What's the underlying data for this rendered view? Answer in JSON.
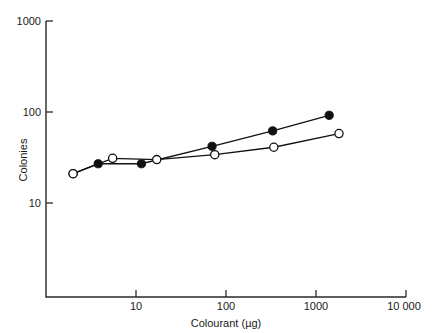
{
  "chart_data": {
    "type": "line",
    "title": "",
    "xlabel": "Colourant (µg)",
    "ylabel": "Colonies",
    "xscale": "log",
    "yscale": "log",
    "xlim": [
      2,
      10000
    ],
    "ylim": [
      5.7,
      1000
    ],
    "grid": false,
    "legend": "none",
    "xticks": [
      {
        "value": 10,
        "label": "10"
      },
      {
        "value": 100,
        "label": "100"
      },
      {
        "value": 1000,
        "label": "1000"
      },
      {
        "value": 10000,
        "label": "10 000"
      }
    ],
    "yticks": [
      {
        "value": 10,
        "label": "10"
      },
      {
        "value": 100,
        "label": "100"
      },
      {
        "value": 1000,
        "label": "1000"
      }
    ],
    "series": [
      {
        "name": "filled-circles",
        "marker": "filled-circle",
        "color": "#111111",
        "points": [
          {
            "x": 2.0,
            "y": 21
          },
          {
            "x": 3.8,
            "y": 27
          },
          {
            "x": 11.5,
            "y": 27
          },
          {
            "x": 70,
            "y": 42
          },
          {
            "x": 330,
            "y": 62
          },
          {
            "x": 1400,
            "y": 92
          }
        ]
      },
      {
        "name": "open-circles",
        "marker": "open-circle",
        "color": "#111111",
        "points": [
          {
            "x": 2.0,
            "y": 21
          },
          {
            "x": 5.5,
            "y": 31
          },
          {
            "x": 17,
            "y": 30
          },
          {
            "x": 75,
            "y": 34
          },
          {
            "x": 340,
            "y": 41
          },
          {
            "x": 1800,
            "y": 58
          }
        ]
      }
    ]
  },
  "axes": {
    "y_title": "Colonies",
    "x_title": "Colourant (µg)",
    "y_top_label": "1000",
    "y_mid_label": "100",
    "y_bot_label": "10",
    "x_labels": [
      "10",
      "100",
      "1000",
      "10 000"
    ]
  }
}
